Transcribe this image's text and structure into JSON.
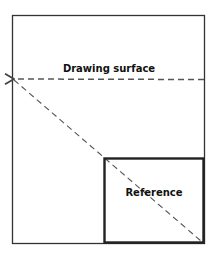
{
  "diagram": {
    "labels": {
      "drawing_surface": "Drawing surface",
      "reference": "Reference"
    },
    "colors": {
      "stroke": "#333333",
      "dashed": "#555555",
      "background": "#ffffff"
    }
  }
}
